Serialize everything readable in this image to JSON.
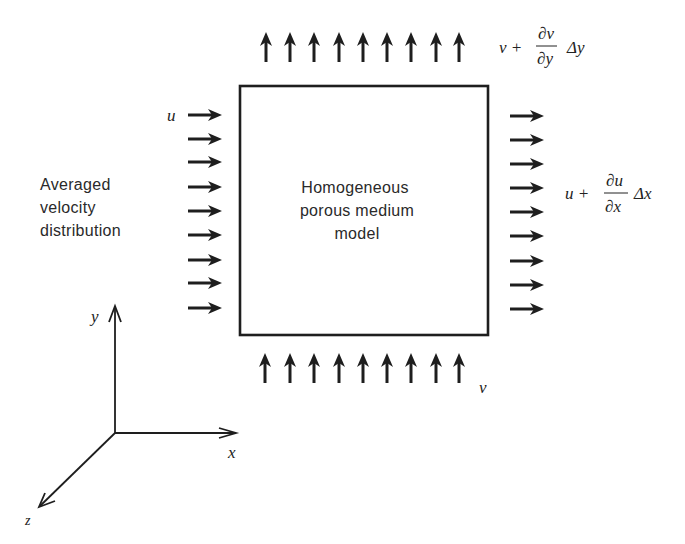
{
  "diagram": {
    "box_label": [
      "Homogeneous",
      "porous medium",
      "model"
    ],
    "side_label": [
      "Averaged",
      "velocity",
      "distribution"
    ],
    "inflow_x": {
      "symbol": "u",
      "arrow_count": 9
    },
    "outflow_x": {
      "lhs": "u +",
      "num": "∂u",
      "den": "∂x",
      "tail": "Δx",
      "arrow_count": 9
    },
    "inflow_y": {
      "symbol": "v",
      "arrow_count": 9
    },
    "outflow_y": {
      "lhs": "v +",
      "num": "∂v",
      "den": "∂y",
      "tail": "Δy",
      "arrow_count": 9
    },
    "axes": {
      "x": "x",
      "y": "y",
      "z": "z"
    },
    "colors": {
      "ink": "#1e1e1e",
      "background": "#ffffff"
    }
  }
}
